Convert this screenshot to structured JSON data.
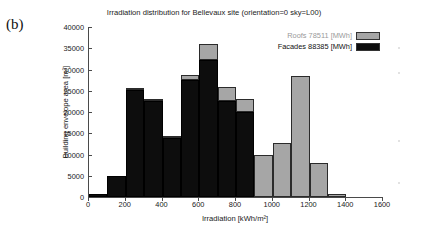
{
  "panel": {
    "label": "(b)"
  },
  "chart_data": {
    "type": "bar",
    "title": "Irradiation distribution for Bellevaux site (orientation=0 sky=L00)",
    "xlabel": "Irradiation [kWh/m²]",
    "ylabel": "Building envelope area [m²]",
    "stacked": true,
    "grid": false,
    "legend_position": "top-right",
    "xlim": [
      0,
      1600
    ],
    "ylim": [
      0,
      40000
    ],
    "xticks": [
      0,
      200,
      400,
      600,
      800,
      1000,
      1200,
      1400,
      1600
    ],
    "yticks": [
      0,
      5000,
      10000,
      15000,
      20000,
      25000,
      30000,
      35000,
      40000
    ],
    "bin_width": 100,
    "bin_starts": [
      0,
      100,
      200,
      300,
      400,
      500,
      600,
      700,
      800,
      900,
      1000,
      1100,
      1200,
      1300
    ],
    "categories": [
      "0-100",
      "100-200",
      "200-300",
      "300-400",
      "400-500",
      "500-600",
      "600-700",
      "700-800",
      "800-900",
      "900-1000",
      "1000-1100",
      "1100-1200",
      "1200-1300",
      "1300-1400"
    ],
    "series": [
      {
        "name": "Facades 88385 [MWh]",
        "color": "#0d0d0d",
        "values": [
          700,
          5000,
          25200,
          22600,
          14000,
          27600,
          32300,
          22500,
          20000,
          0,
          0,
          0,
          0,
          0
        ]
      },
      {
        "name": "Roofs 78511 [MWh]",
        "color": "#a6a6a6",
        "values": [
          0,
          0,
          100,
          500,
          300,
          1000,
          3700,
          3500,
          3100,
          9900,
          12700,
          28500,
          8100,
          700
        ]
      }
    ],
    "legend": [
      {
        "label": "Roofs 78511 [MWh]",
        "color": "#a6a6a6"
      },
      {
        "label": "Facades 88385 [MWh]",
        "color": "#0d0d0d"
      }
    ]
  }
}
